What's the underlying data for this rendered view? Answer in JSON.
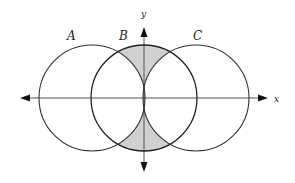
{
  "diagram": {
    "type": "venn-on-coordinate-axes",
    "axes": {
      "x_label": "x",
      "y_label": "y"
    },
    "circles": [
      {
        "label": "A",
        "cx": 92,
        "cy": 98,
        "r": 53
      },
      {
        "label": "B",
        "cx": 144,
        "cy": 98,
        "r": 53
      },
      {
        "label": "C",
        "cx": 196,
        "cy": 98,
        "r": 53
      }
    ],
    "shaded_region": "B minus (A union C)",
    "colors": {
      "stroke": "#333333",
      "axis": "#444444",
      "shade": "#d0d0d0",
      "background": "#ffffff"
    }
  }
}
